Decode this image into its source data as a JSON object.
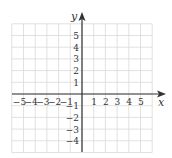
{
  "diagram": {
    "type": "coordinate-plane",
    "x_axis": {
      "label": "x",
      "ticks": [
        "-5",
        "-4",
        "-3",
        "-2",
        "-1",
        "1",
        "2",
        "3",
        "4",
        "5"
      ],
      "range": [
        -6,
        6
      ]
    },
    "y_axis": {
      "label": "y",
      "ticks": [
        "5",
        "4",
        "3",
        "2",
        "1",
        "-1",
        "-2",
        "-3",
        "-4"
      ],
      "range": [
        -5,
        6
      ]
    },
    "grid": {
      "visible": true,
      "color": "#d9d9d9"
    },
    "axis_color": "#333333"
  }
}
